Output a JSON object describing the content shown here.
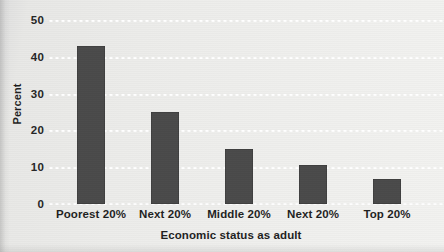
{
  "chart_data": {
    "type": "bar",
    "title": "",
    "xlabel": "Economic status as adult",
    "ylabel": "Percent",
    "categories": [
      "Poorest 20%",
      "Next 20%",
      "Middle 20%",
      "Next 20%",
      "Top 20%"
    ],
    "values": [
      43,
      25,
      15,
      10.5,
      6.8
    ],
    "series": [
      {
        "name": "Percent",
        "values": [
          43,
          25,
          15,
          10.5,
          6.8
        ]
      }
    ],
    "ylim": [
      0,
      50
    ],
    "yticks": [
      0,
      10,
      20,
      30,
      40,
      50
    ],
    "ytick_labels": [
      "0",
      "10",
      "20",
      "30",
      "40",
      "50"
    ],
    "xlim": [
      0,
      5
    ],
    "grid": "horizontal-dotted-white",
    "legend": "none",
    "bar_color": "#4a4a4a",
    "background_color": "#ececea",
    "gridline_color": "#ffffff",
    "text_color": "#1f1f1f"
  },
  "axes": {
    "y_title": "Percent",
    "x_title": "Economic status as adult"
  }
}
